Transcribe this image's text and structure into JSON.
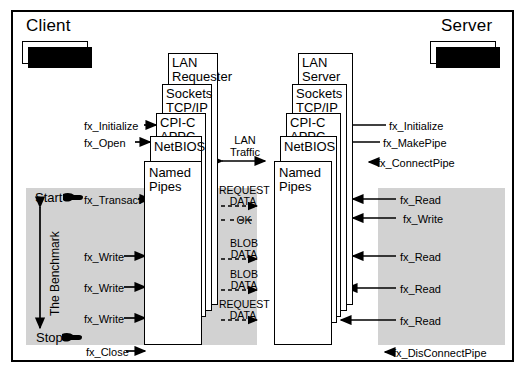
{
  "diagram": {
    "client": {
      "title": "Client",
      "app_box": "FXREQ"
    },
    "server": {
      "title": "Server",
      "app_box": "FXSVR"
    },
    "client_stack": [
      {
        "label": "LAN\nRequester"
      },
      {
        "label": "Sockets\nTCP/IP"
      },
      {
        "label": "CPI-C\nAPPC"
      },
      {
        "label": "NetBIOS"
      },
      {
        "label": "Named\nPipes"
      }
    ],
    "server_stack": [
      {
        "label": "LAN\nServer"
      },
      {
        "label": "Sockets\nTCP/IP"
      },
      {
        "label": "CPI-C\nAPPC"
      },
      {
        "label": "NetBIOS"
      },
      {
        "label": "Named\nPipes"
      }
    ],
    "lan_traffic_label": "LAN\nTraffic",
    "client_calls": [
      {
        "name": "fx_Initialize"
      },
      {
        "name": "fx_Open"
      },
      {
        "name": "fx_Transact"
      },
      {
        "name": "fx_Write"
      },
      {
        "name": "fx_Write"
      },
      {
        "name": "fx_Write"
      },
      {
        "name": "fx_Close"
      }
    ],
    "server_calls": [
      {
        "name": "fx_Initialize"
      },
      {
        "name": "fx_MakePipe"
      },
      {
        "name": "fx_ConnectPipe"
      },
      {
        "name": "fx_Read"
      },
      {
        "name": "fx_Write"
      },
      {
        "name": "fx_Read"
      },
      {
        "name": "fx_Read"
      },
      {
        "name": "fx_Read"
      },
      {
        "name": "fx_DisConnectPipe"
      }
    ],
    "lan_messages": [
      {
        "text": "REQUEST\nDATA"
      },
      {
        "text": "OK"
      },
      {
        "text": "BLOB\nDATA"
      },
      {
        "text": "BLOB\nDATA"
      },
      {
        "text": "REQUEST\nDATA"
      }
    ],
    "benchmark": {
      "start_label": "Start",
      "stop_label": "Stop",
      "axis_label": "The Benchmark"
    },
    "colors": {
      "band": "#d2d2d2",
      "line": "#000000",
      "background": "#ffffff"
    }
  }
}
